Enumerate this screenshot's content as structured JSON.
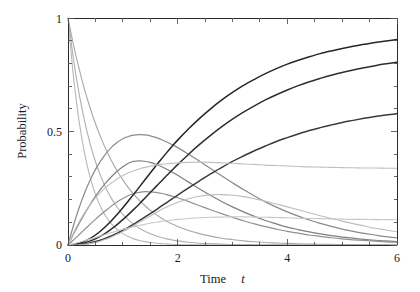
{
  "chart_data": {
    "type": "line",
    "title": "",
    "xlabel": "Time t",
    "ylabel": "Probability",
    "xlim": [
      0,
      6
    ],
    "ylim": [
      0,
      1
    ],
    "xticks": [
      0,
      2,
      4,
      6
    ],
    "xtick_labels": [
      "0",
      "2",
      "4",
      "6"
    ],
    "yticks": [
      0,
      0.5,
      1
    ],
    "ytick_labels": [
      "0",
      "0.5",
      "1"
    ],
    "xminor_ticks": [
      0.5,
      1,
      1.5,
      2.5,
      3,
      3.5,
      4.5,
      5,
      5.5
    ],
    "yminor_ticks": [
      0.1,
      0.2,
      0.3,
      0.4,
      0.6,
      0.7,
      0.8,
      0.9
    ],
    "grid": false,
    "legend": "none",
    "x": [
      0,
      0.1,
      0.2,
      0.3,
      0.4,
      0.5,
      0.6,
      0.7,
      0.8,
      0.9,
      1.0,
      1.1,
      1.2,
      1.3,
      1.4,
      1.5,
      1.6,
      1.7,
      1.8,
      1.9,
      2.0,
      2.2,
      2.4,
      2.6,
      2.8,
      3.0,
      3.2,
      3.4,
      3.6,
      3.8,
      4.0,
      4.2,
      4.4,
      4.6,
      4.8,
      5.0,
      5.2,
      5.4,
      5.6,
      5.8,
      6.0
    ],
    "series": [
      {
        "name": "decay-fast",
        "role": "decaying",
        "shade": "#b8b8b8",
        "width": 1.1,
        "start": 1.0,
        "end": 0.0,
        "values": [
          1.0,
          0.741,
          0.549,
          0.407,
          0.301,
          0.223,
          0.165,
          0.122,
          0.091,
          0.067,
          0.05,
          0.037,
          0.027,
          0.02,
          0.015,
          0.011,
          0.008,
          0.006,
          0.005,
          0.003,
          0.002,
          0.001,
          0.001,
          0.0,
          0.0,
          0.0,
          0.0,
          0.0,
          0.0,
          0.0,
          0.0,
          0.0,
          0.0,
          0.0,
          0.0,
          0.0,
          0.0,
          0.0,
          0.0,
          0.0,
          0.0
        ]
      },
      {
        "name": "decay-medium",
        "role": "decaying",
        "shade": "#b0b0b0",
        "width": 1.1,
        "start": 1.0,
        "end": 0.0,
        "values": [
          1.0,
          0.819,
          0.67,
          0.549,
          0.449,
          0.368,
          0.301,
          0.247,
          0.202,
          0.165,
          0.135,
          0.111,
          0.091,
          0.074,
          0.061,
          0.05,
          0.041,
          0.033,
          0.027,
          0.022,
          0.018,
          0.012,
          0.008,
          0.006,
          0.004,
          0.002,
          0.002,
          0.001,
          0.001,
          0.001,
          0.0,
          0.0,
          0.0,
          0.0,
          0.0,
          0.0,
          0.0,
          0.0,
          0.0,
          0.0,
          0.0
        ]
      },
      {
        "name": "decay-slow",
        "role": "decaying",
        "shade": "#a8a8a8",
        "width": 1.1,
        "start": 1.0,
        "end": 0.0,
        "values": [
          1.0,
          0.882,
          0.779,
          0.687,
          0.607,
          0.535,
          0.472,
          0.417,
          0.368,
          0.325,
          0.287,
          0.253,
          0.223,
          0.197,
          0.174,
          0.153,
          0.135,
          0.119,
          0.105,
          0.093,
          0.082,
          0.064,
          0.05,
          0.039,
          0.03,
          0.024,
          0.018,
          0.014,
          0.011,
          0.009,
          0.007,
          0.005,
          0.004,
          0.003,
          0.003,
          0.002,
          0.002,
          0.001,
          0.001,
          0.001,
          0.001
        ]
      },
      {
        "name": "intermediate-high",
        "role": "peaked",
        "shade": "#8a8a8a",
        "width": 1.2,
        "peak_t": 1.1,
        "peak_value": 0.49,
        "values": [
          0.0,
          0.086,
          0.162,
          0.228,
          0.284,
          0.332,
          0.372,
          0.405,
          0.432,
          0.453,
          0.468,
          0.478,
          0.484,
          0.486,
          0.485,
          0.481,
          0.474,
          0.465,
          0.454,
          0.442,
          0.429,
          0.4,
          0.369,
          0.337,
          0.305,
          0.274,
          0.244,
          0.216,
          0.19,
          0.167,
          0.146,
          0.127,
          0.11,
          0.095,
          0.082,
          0.07,
          0.06,
          0.051,
          0.044,
          0.037,
          0.032
        ]
      },
      {
        "name": "intermediate-mid",
        "role": "peaked",
        "shade": "#808080",
        "width": 1.2,
        "peak_t": 1.3,
        "peak_value": 0.37,
        "values": [
          0.0,
          0.048,
          0.094,
          0.137,
          0.177,
          0.214,
          0.247,
          0.277,
          0.303,
          0.326,
          0.345,
          0.36,
          0.369,
          0.371,
          0.369,
          0.364,
          0.356,
          0.346,
          0.334,
          0.321,
          0.307,
          0.277,
          0.247,
          0.219,
          0.192,
          0.168,
          0.146,
          0.126,
          0.108,
          0.093,
          0.079,
          0.068,
          0.058,
          0.049,
          0.041,
          0.035,
          0.03,
          0.025,
          0.021,
          0.018,
          0.015
        ]
      },
      {
        "name": "intermediate-low",
        "role": "peaked",
        "shade": "#909090",
        "width": 1.2,
        "peak_t": 1.45,
        "peak_value": 0.235,
        "values": [
          0.0,
          0.022,
          0.045,
          0.068,
          0.091,
          0.113,
          0.134,
          0.154,
          0.173,
          0.19,
          0.205,
          0.218,
          0.227,
          0.232,
          0.235,
          0.234,
          0.232,
          0.228,
          0.222,
          0.215,
          0.208,
          0.191,
          0.173,
          0.155,
          0.138,
          0.122,
          0.107,
          0.093,
          0.081,
          0.07,
          0.06,
          0.052,
          0.044,
          0.038,
          0.032,
          0.027,
          0.023,
          0.02,
          0.017,
          0.014,
          0.012
        ]
      },
      {
        "name": "product-high",
        "role": "rising",
        "shade": "#262626",
        "width": 1.5,
        "asymptote": 0.96,
        "values": [
          0.0,
          0.002,
          0.007,
          0.016,
          0.028,
          0.044,
          0.063,
          0.085,
          0.109,
          0.136,
          0.164,
          0.194,
          0.224,
          0.255,
          0.286,
          0.317,
          0.348,
          0.378,
          0.407,
          0.435,
          0.462,
          0.512,
          0.558,
          0.6,
          0.638,
          0.672,
          0.703,
          0.73,
          0.755,
          0.777,
          0.797,
          0.814,
          0.829,
          0.843,
          0.855,
          0.866,
          0.876,
          0.884,
          0.892,
          0.899,
          0.905
        ]
      },
      {
        "name": "product-mid",
        "role": "rising",
        "shade": "#2e2e2e",
        "width": 1.5,
        "asymptote": 0.82,
        "values": [
          0.0,
          0.001,
          0.004,
          0.009,
          0.017,
          0.027,
          0.04,
          0.055,
          0.072,
          0.091,
          0.112,
          0.134,
          0.157,
          0.181,
          0.206,
          0.231,
          0.256,
          0.281,
          0.306,
          0.33,
          0.354,
          0.4,
          0.443,
          0.483,
          0.52,
          0.554,
          0.585,
          0.613,
          0.639,
          0.662,
          0.683,
          0.702,
          0.719,
          0.734,
          0.748,
          0.76,
          0.771,
          0.781,
          0.79,
          0.798,
          0.805
        ]
      },
      {
        "name": "product-low",
        "role": "rising",
        "shade": "#3a3a3a",
        "width": 1.5,
        "asymptote": 0.59,
        "values": [
          0.0,
          0.0,
          0.002,
          0.005,
          0.009,
          0.015,
          0.022,
          0.031,
          0.041,
          0.052,
          0.065,
          0.078,
          0.092,
          0.107,
          0.123,
          0.138,
          0.154,
          0.171,
          0.187,
          0.203,
          0.22,
          0.252,
          0.283,
          0.313,
          0.341,
          0.368,
          0.392,
          0.415,
          0.436,
          0.456,
          0.473,
          0.489,
          0.504,
          0.517,
          0.529,
          0.54,
          0.549,
          0.558,
          0.566,
          0.573,
          0.579
        ]
      },
      {
        "name": "plateau-mid",
        "role": "rise-to-plateau",
        "shade": "#c0c0c0",
        "width": 1.1,
        "asymptote": 0.34,
        "values": [
          0.0,
          0.053,
          0.1,
          0.141,
          0.176,
          0.207,
          0.233,
          0.256,
          0.275,
          0.292,
          0.306,
          0.318,
          0.327,
          0.335,
          0.342,
          0.347,
          0.352,
          0.355,
          0.358,
          0.36,
          0.362,
          0.364,
          0.365,
          0.364,
          0.362,
          0.36,
          0.357,
          0.355,
          0.352,
          0.35,
          0.348,
          0.346,
          0.344,
          0.343,
          0.342,
          0.341,
          0.34,
          0.339,
          0.339,
          0.338,
          0.338
        ]
      },
      {
        "name": "plateau-low",
        "role": "rise-to-plateau",
        "shade": "#c8c8c8",
        "width": 1.1,
        "asymptote": 0.11,
        "values": [
          0.0,
          0.006,
          0.012,
          0.019,
          0.026,
          0.033,
          0.041,
          0.048,
          0.055,
          0.062,
          0.069,
          0.075,
          0.081,
          0.086,
          0.091,
          0.096,
          0.1,
          0.104,
          0.107,
          0.11,
          0.113,
          0.117,
          0.12,
          0.122,
          0.123,
          0.124,
          0.124,
          0.123,
          0.122,
          0.121,
          0.12,
          0.118,
          0.117,
          0.116,
          0.115,
          0.114,
          0.113,
          0.113,
          0.112,
          0.112,
          0.111
        ]
      },
      {
        "name": "slow-bump",
        "role": "broad-decay",
        "shade": "#bdbdbd",
        "width": 1.1,
        "asymptote": 0.0,
        "values": [
          0.0,
          0.0,
          0.001,
          0.003,
          0.006,
          0.011,
          0.018,
          0.026,
          0.036,
          0.047,
          0.059,
          0.072,
          0.086,
          0.1,
          0.114,
          0.128,
          0.142,
          0.155,
          0.167,
          0.178,
          0.188,
          0.204,
          0.215,
          0.221,
          0.222,
          0.219,
          0.213,
          0.204,
          0.193,
          0.181,
          0.168,
          0.155,
          0.142,
          0.129,
          0.117,
          0.105,
          0.094,
          0.084,
          0.074,
          0.066,
          0.058
        ]
      }
    ]
  },
  "axes": {
    "x_label_main": "Time",
    "x_label_var": "t",
    "y_label": "Probability",
    "x_tick_0": "0",
    "x_tick_1": "2",
    "x_tick_2": "4",
    "x_tick_3": "6",
    "y_tick_0": "0",
    "y_tick_1": "0.5",
    "y_tick_2": "1"
  },
  "colors": {
    "axis": "#2b2b2b",
    "tick": "#555555",
    "text": "#1a1a1a",
    "background": "#ffffff"
  }
}
